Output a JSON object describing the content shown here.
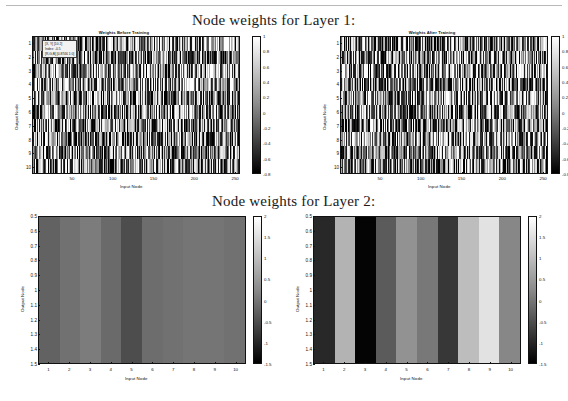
{
  "figure": {
    "title_layer1": "Node weights for Layer 1:",
    "title_layer2": "Node weights for Layer 2:"
  },
  "panels": {
    "top_left": {
      "title": "Weights Before Training",
      "xlabel": "Input Node",
      "ylabel": "Output Node",
      "xticks": [
        "50",
        "100",
        "150",
        "200",
        "250"
      ],
      "yticks": [
        "1",
        "2",
        "3",
        "4",
        "5",
        "6",
        "7",
        "8",
        "9",
        "10"
      ],
      "colorbar_ticks": [
        "1",
        "0.8",
        "0.6",
        "0.4",
        "0.2",
        "0",
        "-0.2",
        "-0.4",
        "-0.6",
        "-0.8"
      ],
      "tooltip": {
        "line1": "[X, Y] [10 2]",
        "line2": "Index: -0.5",
        "line3": "[R,G,B] [0.8746 1 0]"
      }
    },
    "top_right": {
      "title": "Weights After Training",
      "xlabel": "Input Node",
      "ylabel": "Output Node",
      "xticks": [
        "50",
        "100",
        "150",
        "200",
        "250"
      ],
      "yticks": [
        "1",
        "2",
        "3",
        "4",
        "5",
        "6",
        "7",
        "8",
        "9",
        "10"
      ],
      "colorbar_ticks": [
        "1",
        "0.8",
        "0.6",
        "0.4",
        "0.2",
        "0",
        "-0.2",
        "-0.4",
        "-0.6",
        "-0.8"
      ]
    },
    "bottom_left": {
      "xlabel": "Input Node",
      "ylabel": "Output Node",
      "xticks": [
        "1",
        "2",
        "3",
        "4",
        "5",
        "6",
        "7",
        "8",
        "9",
        "10"
      ],
      "yticks": [
        "0.5",
        "0.6",
        "0.7",
        "0.8",
        "0.9",
        "1",
        "1.1",
        "1.2",
        "1.3",
        "1.4",
        "1.5"
      ],
      "colorbar_ticks": [
        "2",
        "1.5",
        "1",
        "0.5",
        "0",
        "-0.5",
        "-1",
        "-1.5"
      ]
    },
    "bottom_right": {
      "xlabel": "Input Node",
      "ylabel": "Output Node",
      "xticks": [
        "1",
        "2",
        "3",
        "4",
        "5",
        "6",
        "7",
        "8",
        "9",
        "10"
      ],
      "yticks": [
        "0.5",
        "0.6",
        "0.7",
        "0.8",
        "0.9",
        "1",
        "1.1",
        "1.2",
        "1.3",
        "1.4",
        "1.5"
      ],
      "colorbar_ticks": [
        "2",
        "1.5",
        "1",
        "0.5",
        "0",
        "-0.5",
        "-1",
        "-1.5"
      ]
    }
  },
  "chart_data": [
    {
      "type": "heatmap",
      "id": "layer1-before-training",
      "title": "Weights Before Training",
      "xlabel": "Input Node",
      "ylabel": "Output Node",
      "xlim": [
        1,
        256
      ],
      "ylim": [
        1,
        10
      ],
      "clim": [
        -0.9,
        1.05
      ],
      "colormap": "gray",
      "rows": 10,
      "cols": 256,
      "description": "Randomly initialised weight matrix: dense vertical noise stripes spanning the full grey range.",
      "seed": 17,
      "grid": false,
      "legend": "colorbar-right"
    },
    {
      "type": "heatmap",
      "id": "layer1-after-training",
      "title": "Weights After Training",
      "xlabel": "Input Node",
      "ylabel": "Output Node",
      "xlim": [
        1,
        256
      ],
      "ylim": [
        1,
        10
      ],
      "clim": [
        -0.9,
        1.05
      ],
      "colormap": "gray",
      "rows": 10,
      "cols": 256,
      "description": "Trained weight matrix: dense vertical noise stripes, slightly higher contrast with more near-black columns.",
      "seed": 93,
      "grid": false,
      "legend": "colorbar-right"
    },
    {
      "type": "heatmap",
      "id": "layer2-before-training",
      "title": "",
      "xlabel": "Input Node",
      "ylabel": "Output Node",
      "categories": [
        "1",
        "2",
        "3",
        "4",
        "5",
        "6",
        "7",
        "8",
        "9",
        "10"
      ],
      "values": [
        -0.15,
        0.05,
        0.2,
        -0.05,
        -0.45,
        0.0,
        0.05,
        0.1,
        0.1,
        0.05
      ],
      "xlim": [
        0.5,
        10.5
      ],
      "ylim": [
        0.5,
        1.5
      ],
      "clim": [
        -1.5,
        2.0
      ],
      "colormap": "gray",
      "rows": 1,
      "cols": 10,
      "description": "Untrained layer-2 weights: all columns close to mid grey, small variation around zero.",
      "grid": false,
      "legend": "colorbar-right"
    },
    {
      "type": "heatmap",
      "id": "layer2-after-training",
      "title": "",
      "xlabel": "Input Node",
      "ylabel": "Output Node",
      "categories": [
        "1",
        "2",
        "3",
        "4",
        "5",
        "6",
        "7",
        "8",
        "9",
        "10"
      ],
      "values": [
        -0.95,
        0.95,
        -1.45,
        -0.25,
        0.5,
        0.15,
        -0.75,
        1.1,
        1.6,
        0.35
      ],
      "xlim": [
        0.5,
        10.5
      ],
      "ylim": [
        0.5,
        1.5
      ],
      "clim": [
        -1.5,
        2.0
      ],
      "colormap": "gray",
      "rows": 1,
      "cols": 10,
      "description": "Trained layer-2 weights: strong column contrast from near black (node 3) to near white (node 9).",
      "grid": false,
      "legend": "colorbar-right"
    }
  ]
}
